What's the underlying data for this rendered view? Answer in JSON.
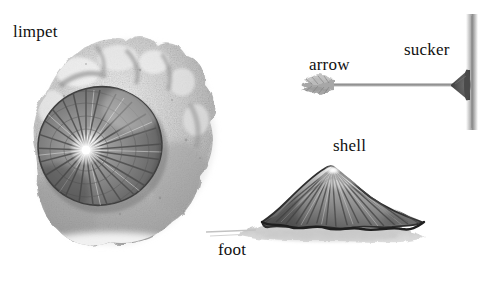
{
  "figure": {
    "background_color": "#ffffff",
    "style": "grayscale pencil/wash illustration",
    "width": 501,
    "height": 282
  },
  "labels": {
    "limpet": "limpet",
    "arrow": "arrow",
    "sucker": "sucker",
    "shell": "shell",
    "foot": "foot"
  },
  "palette": {
    "ink": "#101010",
    "rock_light": "#e2e2e2",
    "rock_mid": "#b4b4b4",
    "rock_dark": "#7d7d7d",
    "shell_dark": "#4a4a4a",
    "shell_mid": "#8a8a8a",
    "shell_light": "#d8d8d8",
    "foot_gray": "#cfcfcf",
    "wall_gray": "#9a9a9a",
    "arrow_gray": "#8c8c8c",
    "sucker_dark": "#565656"
  },
  "parts": {
    "limpet_on_rock": {
      "name": "limpet attached to rock",
      "shell_apex_highlight": "bright white center",
      "rib_count": 26
    },
    "arrow_diagram": {
      "name": "arrow with rubber sucker tip striking a vertical surface",
      "direction": "pointing right",
      "fletching": "left end",
      "sucker_tip": "right end, dark cone",
      "surface": "vertical gray wall"
    },
    "shell_side_view": {
      "name": "limpet shell side profile above muscular foot",
      "rib_count": 18,
      "foot": "pale gray muscular foot beneath shell"
    }
  }
}
